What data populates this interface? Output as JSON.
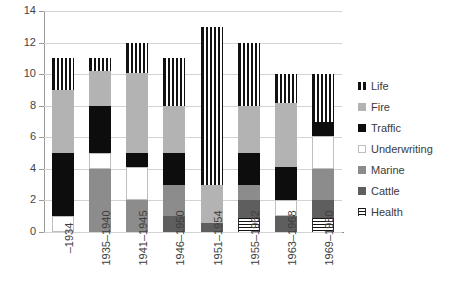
{
  "chart_data": {
    "type": "bar",
    "subtype": "stacked-bar",
    "title": "",
    "xlabel": "",
    "ylabel": "",
    "ylim": [
      0,
      14
    ],
    "ytick_step": 2,
    "ytick_labels": [
      "0",
      "2",
      "4",
      "6",
      "8",
      "10",
      "12",
      "14"
    ],
    "grid": true,
    "legend_position": "right",
    "categories": [
      "–1934",
      "1935–1940",
      "1941–1945",
      "1946–1950",
      "1951–1954",
      "1955–1962",
      "1963–1968",
      "1969–1980"
    ],
    "series": [
      {
        "name": "Life",
        "color": "#111111",
        "pattern": "vertical-stripes",
        "values": [
          2,
          0.8,
          1.9,
          3,
          10,
          4,
          1.8,
          3
        ]
      },
      {
        "name": "Fire",
        "color": "#b3b3b3",
        "pattern": "solid",
        "values": [
          4,
          2.2,
          5.1,
          3,
          2.4,
          3,
          4.1,
          0
        ]
      },
      {
        "name": "Traffic",
        "color": "#0d0d0d",
        "pattern": "solid",
        "values": [
          4,
          3,
          0.9,
          2,
          0,
          2,
          2.1,
          0.9
        ]
      },
      {
        "name": "Underwriting",
        "color": "#ffffff",
        "pattern": "solid-outline",
        "values": [
          1,
          1,
          2.1,
          0,
          0,
          0,
          1,
          2.1
        ]
      },
      {
        "name": "Marine",
        "color": "#8c8c8c",
        "pattern": "solid",
        "values": [
          0,
          4,
          2,
          2,
          0,
          1,
          0,
          2
        ]
      },
      {
        "name": "Cattle",
        "color": "#5e5e5e",
        "pattern": "solid",
        "values": [
          0,
          0,
          0,
          1,
          0.6,
          1.1,
          1,
          1.1
        ]
      },
      {
        "name": "Health",
        "color": "#141414",
        "pattern": "horizontal-stripes",
        "values": [
          0,
          0,
          0,
          0,
          0,
          0.9,
          0,
          0.9
        ]
      }
    ],
    "stack_order_bottom_to_top": [
      "Health",
      "Cattle",
      "Marine",
      "Underwriting",
      "Traffic",
      "Fire",
      "Life"
    ],
    "totals": [
      11,
      11,
      12,
      11,
      13,
      12,
      10,
      10
    ]
  },
  "legend": {
    "items": [
      {
        "label": "Life"
      },
      {
        "label": "Fire"
      },
      {
        "label": "Traffic"
      },
      {
        "label": "Underwriting"
      },
      {
        "label": "Marine"
      },
      {
        "label": "Cattle"
      },
      {
        "label": "Health"
      }
    ]
  }
}
